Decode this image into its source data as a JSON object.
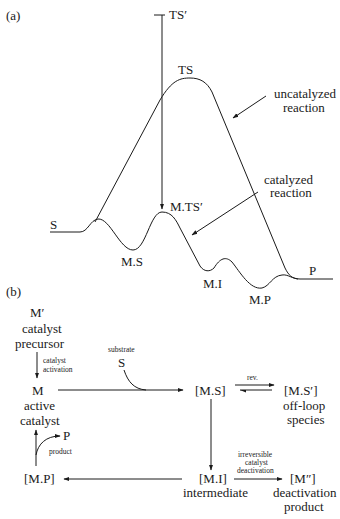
{
  "panel_a": {
    "label": "(a)",
    "states": {
      "S": "S",
      "TS_prime": "TS′",
      "TS": "TS",
      "MTS_prime": "M.TS′",
      "MS": "M.S",
      "MI": "M.I",
      "MP": "M.P",
      "P": "P"
    },
    "annotations": {
      "uncatalyzed_line1": "uncatalyzed",
      "uncatalyzed_line2": "reaction",
      "catalyzed_line1": "catalyzed",
      "catalyzed_line2": "reaction"
    }
  },
  "panel_b": {
    "label": "(b)",
    "nodes": {
      "precursor_symbol": "M′",
      "precursor_line1": "catalyst",
      "precursor_line2": "precursor",
      "active_symbol": "M",
      "active_line1": "active",
      "active_line2": "catalyst",
      "ms": "[M.S]",
      "ms_prime": "[M.S′]",
      "offloop_line1": "off-loop",
      "offloop_line2": "species",
      "mi": "[M.I]",
      "mi_desc": "intermediate",
      "mpp": "[M″]",
      "deact_line1": "deactivation",
      "deact_line2": "product",
      "mp": "[M.P]"
    },
    "edges": {
      "activation_line1": "catalyst",
      "activation_line2": "activation",
      "substrate_label": "substrate",
      "substrate_symbol": "S",
      "rev": "rev.",
      "irrev_line1": "irreversible",
      "irrev_line2": "catalyst",
      "irrev_line3": "deactivation",
      "product_symbol": "P",
      "product_label": "product"
    }
  }
}
